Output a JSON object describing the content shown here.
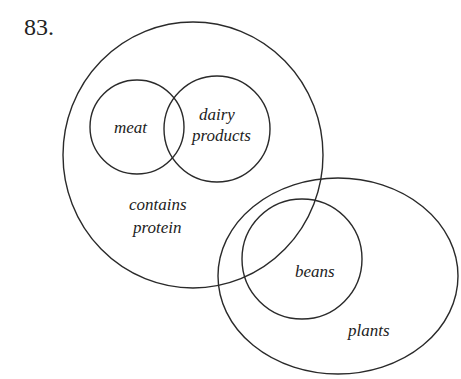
{
  "problem_number": "83.",
  "diagram": {
    "type": "venn",
    "sets": [
      {
        "id": "protein",
        "label_lines": [
          "contains",
          "protein"
        ],
        "shape": "circle"
      },
      {
        "id": "meat",
        "label_lines": [
          "meat"
        ],
        "shape": "circle",
        "inside": "protein"
      },
      {
        "id": "dairy",
        "label_lines": [
          "dairy",
          "products"
        ],
        "shape": "circle",
        "inside": "protein"
      },
      {
        "id": "plants",
        "label_lines": [
          "plants"
        ],
        "shape": "ellipse"
      },
      {
        "id": "beans",
        "label_lines": [
          "beans"
        ],
        "shape": "circle",
        "inside": "plants"
      }
    ],
    "relations": [
      "meat overlaps dairy products",
      "contains protein overlaps plants",
      "beans overlaps contains protein"
    ]
  },
  "labels": {
    "meat": "meat",
    "dairy_1": "dairy",
    "dairy_2": "products",
    "protein_1": "contains",
    "protein_2": "protein",
    "beans": "beans",
    "plants": "plants"
  }
}
